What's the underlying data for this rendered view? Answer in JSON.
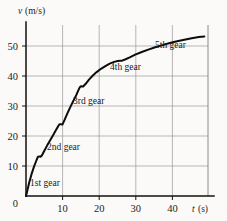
{
  "chart_data": {
    "type": "line",
    "title": "",
    "subtitle": "",
    "xlabel": "t (s)",
    "ylabel": "v (m/s)",
    "xlabel_symbol": "t",
    "xlabel_unit": "(s)",
    "ylabel_symbol": "v",
    "ylabel_unit": "(m/s)",
    "xlim": [
      0,
      50
    ],
    "ylim": [
      0,
      57
    ],
    "xticks": [
      0,
      10,
      20,
      30,
      40
    ],
    "yticks": [
      0,
      10,
      20,
      30,
      40,
      50
    ],
    "xtick_labels": [
      "0",
      "10",
      "20",
      "30",
      "40"
    ],
    "ytick_labels": [
      "0",
      "10",
      "20",
      "30",
      "40",
      "50"
    ],
    "grid": true,
    "grid_x_values": [
      10,
      20,
      30,
      40
    ],
    "grid_y_values": [
      10,
      20,
      30,
      40,
      50
    ],
    "legend": "none",
    "legend_position": "none",
    "curve_color": "#0d0d0d",
    "grid_color": "#9a9a9a",
    "axis_color": "#111111",
    "background_color": "#fbfaf8",
    "series": [
      {
        "name": "car speed through the gears",
        "x": [
          0.0,
          0.4,
          0.9,
          1.5,
          2.2,
          2.9,
          3.3,
          3.7,
          4.0,
          4.4,
          5.0,
          5.8,
          6.6,
          7.4,
          8.2,
          8.8,
          9.2,
          9.6,
          10.0,
          10.6,
          11.4,
          12.2,
          13.0,
          13.8,
          14.4,
          14.8,
          15.2,
          15.7,
          16.4,
          17.3,
          18.3,
          19.4,
          20.6,
          21.8,
          23.0,
          24.2,
          25.2,
          25.9,
          26.4,
          27.2,
          28.5,
          30.0,
          31.8,
          33.6,
          35.5,
          37.5,
          39.5,
          41.5,
          43.5,
          45.5,
          47.5,
          49.0
        ],
        "y": [
          0.0,
          2.0,
          4.6,
          7.2,
          9.8,
          12.0,
          13.1,
          13.2,
          13.1,
          13.6,
          15.0,
          16.8,
          18.5,
          20.2,
          21.9,
          23.2,
          23.9,
          23.9,
          23.8,
          25.4,
          27.6,
          29.7,
          31.7,
          33.6,
          35.3,
          36.3,
          36.6,
          36.5,
          37.4,
          38.8,
          40.1,
          41.3,
          42.4,
          43.3,
          44.1,
          44.7,
          45.0,
          45.1,
          45.1,
          45.5,
          46.2,
          47.1,
          48.0,
          48.8,
          49.6,
          50.3,
          51.0,
          51.6,
          52.1,
          52.6,
          53.0,
          53.2
        ]
      }
    ],
    "annotations": [
      {
        "label": "1st gear",
        "x_value": 6.5,
        "y_value": 9.0,
        "gear": 1
      },
      {
        "label": "2nd gear",
        "x_value": 11.5,
        "y_value": 19.5,
        "gear": 2
      },
      {
        "label": "3rd gear",
        "x_value": 17.0,
        "y_value": 30.5,
        "gear": 3
      },
      {
        "label": "4th gear",
        "x_value": 26.5,
        "y_value": 41.5,
        "gear": 4
      },
      {
        "label": "5th gear",
        "x_value": 37.0,
        "y_value": 48.0,
        "gear": 5
      }
    ],
    "gear_change_points": [
      {
        "gear_from": 1,
        "gear_to": 2,
        "t": 3.5,
        "v": 13.2
      },
      {
        "gear_from": 2,
        "gear_to": 3,
        "t": 9.4,
        "v": 23.9
      },
      {
        "gear_from": 3,
        "gear_to": 4,
        "t": 15.0,
        "v": 36.5
      },
      {
        "gear_from": 4,
        "gear_to": 5,
        "t": 26.0,
        "v": 45.1
      }
    ]
  }
}
